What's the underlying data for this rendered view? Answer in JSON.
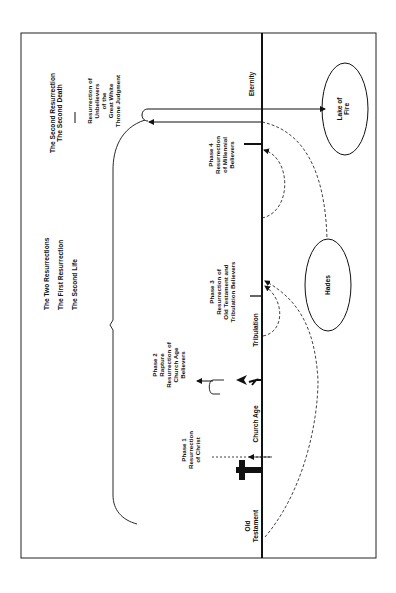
{
  "diagram": {
    "title_group_second": {
      "line1": "The Second Resurrection",
      "line2": "The Second Death"
    },
    "title_group_first": {
      "line1": "The Two Resurrections",
      "line2": "The First Resurrection",
      "line3": "The Second Life"
    },
    "unbelievers": {
      "line1": "Resurrection of",
      "line2": "Unbelievers",
      "line3": "of the",
      "line4": "Great White",
      "line5": "Throne Judgment"
    },
    "eras": {
      "old_testament_1": "Old",
      "old_testament_2": "Testament",
      "church_age": "Church Age",
      "tribulation": "Tribulation",
      "eternity": "Eternity"
    },
    "phases": [
      {
        "line1": "Phase 1",
        "line2": "Resurrection",
        "line3": "of Christ"
      },
      {
        "line1": "Phase 2",
        "line2": "Rapture",
        "line3": "Resurrection of",
        "line4": "Church Age",
        "line5": "Believers"
      },
      {
        "line1": "Phase 3",
        "line2": "Resurrection of",
        "line3": "Old Testament and",
        "line4": "Tribulation Believers"
      },
      {
        "line1": "Phase 4",
        "line2": "Resurrection",
        "line3": "of Millennial",
        "line4": "Believers"
      }
    ],
    "places": {
      "lake_of_fire_1": "Lake of",
      "lake_of_fire_2": "Fire",
      "hades": "Hades"
    },
    "colors": {
      "ink": "#111111",
      "paper": "#ffffff"
    }
  }
}
